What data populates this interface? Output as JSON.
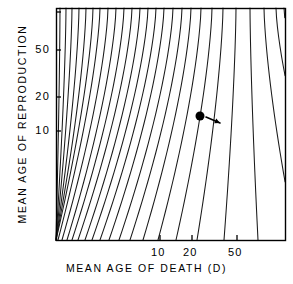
{
  "chart_data": {
    "type": "line",
    "title": "",
    "subtitle": "",
    "xlabel": "MEAN AGE OF DEATH (D)",
    "ylabel": "MEAN AGE OF REPRODUCTION",
    "xscale": "log",
    "yscale": "log",
    "grid": false,
    "legend": null,
    "xticks": [
      {
        "value": 10,
        "label": "10",
        "px": 160
      },
      {
        "value": 20,
        "label": "20",
        "px": 192
      },
      {
        "value": 50,
        "label": "50",
        "px": 237
      }
    ],
    "yticks": [
      {
        "value": 50,
        "label": "50",
        "px": 50
      },
      {
        "value": 20,
        "label": "20",
        "px": 97
      },
      {
        "value": 10,
        "label": "10",
        "px": 131
      }
    ],
    "plot_frame": {
      "left": 56,
      "top": 8,
      "right": 285,
      "bottom": 240
    },
    "contour_count": 26,
    "contour_description": "Family of 26 curved isoclines sweeping from lower-left to upper-right, densely packed in the upper-left region and widely spaced toward the lower-right.",
    "annotations": [
      {
        "kind": "point-marker",
        "shape": "filled-circle",
        "x_px": 200,
        "y_px": 116,
        "x_value": 24,
        "y_value": 13,
        "radius_px": 4.5
      },
      {
        "kind": "arrow",
        "from_px": [
          206,
          117
        ],
        "to_px": [
          220,
          123
        ],
        "direction": "right-down",
        "label": ""
      }
    ],
    "series": [
      {
        "name": "isocline",
        "index": 1,
        "top_x_px": 60,
        "bottom_x_px": 56
      },
      {
        "name": "isocline",
        "index": 2,
        "top_x_px": 66,
        "bottom_x_px": 56
      },
      {
        "name": "isocline",
        "index": 3,
        "top_x_px": 72,
        "bottom_x_px": 56
      },
      {
        "name": "isocline",
        "index": 4,
        "top_x_px": 79,
        "bottom_x_px": 56
      },
      {
        "name": "isocline",
        "index": 5,
        "top_x_px": 86,
        "bottom_x_px": 56
      },
      {
        "name": "isocline",
        "index": 6,
        "top_x_px": 93,
        "bottom_x_px": 56
      },
      {
        "name": "isocline",
        "index": 7,
        "top_x_px": 100,
        "bottom_x_px": 58
      },
      {
        "name": "isocline",
        "index": 8,
        "top_x_px": 108,
        "bottom_x_px": 62
      },
      {
        "name": "isocline",
        "index": 9,
        "top_x_px": 116,
        "bottom_x_px": 67
      },
      {
        "name": "isocline",
        "index": 10,
        "top_x_px": 124,
        "bottom_x_px": 72
      },
      {
        "name": "isocline",
        "index": 11,
        "top_x_px": 132,
        "bottom_x_px": 78
      },
      {
        "name": "isocline",
        "index": 12,
        "top_x_px": 140,
        "bottom_x_px": 85
      },
      {
        "name": "isocline",
        "index": 13,
        "top_x_px": 148,
        "bottom_x_px": 92
      },
      {
        "name": "isocline",
        "index": 14,
        "top_x_px": 156,
        "bottom_x_px": 100
      },
      {
        "name": "isocline",
        "index": 15,
        "top_x_px": 164,
        "bottom_x_px": 109
      },
      {
        "name": "isocline",
        "index": 16,
        "top_x_px": 173,
        "bottom_x_px": 119
      },
      {
        "name": "isocline",
        "index": 17,
        "top_x_px": 182,
        "bottom_x_px": 130
      },
      {
        "name": "isocline",
        "index": 18,
        "top_x_px": 191,
        "bottom_x_px": 143
      },
      {
        "name": "isocline",
        "index": 19,
        "top_x_px": 201,
        "bottom_x_px": 158
      },
      {
        "name": "isocline",
        "index": 20,
        "top_x_px": 212,
        "bottom_x_px": 176
      },
      {
        "name": "isocline",
        "index": 21,
        "top_x_px": 223,
        "bottom_x_px": 197
      },
      {
        "name": "isocline",
        "index": 22,
        "top_x_px": 236,
        "bottom_x_px": 224
      },
      {
        "name": "isocline",
        "index": 23,
        "top_x_px": 250,
        "bottom_x_px": 258
      },
      {
        "name": "isocline",
        "index": 24,
        "top_x_px": 264,
        "bottom_x_px": 296
      },
      {
        "name": "isocline",
        "index": 25,
        "top_x_px": 276,
        "bottom_x_px": 330
      },
      {
        "name": "isocline",
        "index": 26,
        "top_x_px": 284,
        "bottom_x_px": 360
      }
    ]
  },
  "style": {
    "line_color": "#1a1a1a",
    "frame_color": "#000000",
    "background": "#ffffff",
    "marker_color": "#000000"
  }
}
